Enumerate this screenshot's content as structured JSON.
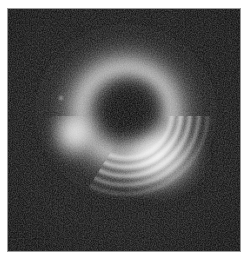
{
  "figure": {
    "kind": "scientific-raster-image",
    "colormap": "grayscale",
    "background_color": "#0a0a0a",
    "page_background_color": "#ffffff",
    "frame_color": "#9a9a9a",
    "peak_color": "#f2f2f2",
    "shadow_color": "#121212",
    "margin_px": 8,
    "raster_width_px": 232,
    "raster_height_px": 242
  },
  "image_content": {
    "center_x": 125,
    "center_y": 107,
    "shadow_radius": 34,
    "ring_inner_radius": 36,
    "ring_outer_radius": 74,
    "halo_radius": 104,
    "bright_lobe_left": {
      "angle_deg": 185,
      "peak_brightness": 0.82,
      "description": "smooth unresolved bright lobe, west side"
    },
    "bright_lobe_lower_right": {
      "angle_deg": 320,
      "peak_brightness": 1.0,
      "description": "brightest arc sector with concentric fringes, southeast"
    },
    "fringe_count": 5,
    "fringe_spacing_px": 9,
    "noise_level": 0.14,
    "hot_pixels": [
      {
        "x": 61,
        "y": 97,
        "brightness": 0.55
      },
      {
        "x": 138,
        "y": 182,
        "brightness": 0.3
      }
    ]
  },
  "chart_data": {
    "type": "heatmap",
    "xlabel": "",
    "ylabel": "",
    "grid": false,
    "legend": "none",
    "colormap": "gray",
    "x": [
      0,
      232
    ],
    "y": [
      0,
      242
    ],
    "zlim": [
      0,
      1
    ],
    "annotations": [],
    "features": [
      {
        "name": "central shadow",
        "cx": 125,
        "cy": 107,
        "r": 34,
        "value": 0.05
      },
      {
        "name": "bright ring",
        "cx": 125,
        "cy": 107,
        "r_inner": 36,
        "r_outer": 74,
        "value": 0.6
      },
      {
        "name": "west lobe",
        "cx": 72,
        "cy": 128,
        "r": 26,
        "value": 0.82
      },
      {
        "name": "southeast fringed arc",
        "cx": 158,
        "cy": 150,
        "r": 40,
        "value": 1.0
      },
      {
        "name": "outer halo",
        "cx": 125,
        "cy": 110,
        "r": 104,
        "value": 0.12
      }
    ]
  }
}
